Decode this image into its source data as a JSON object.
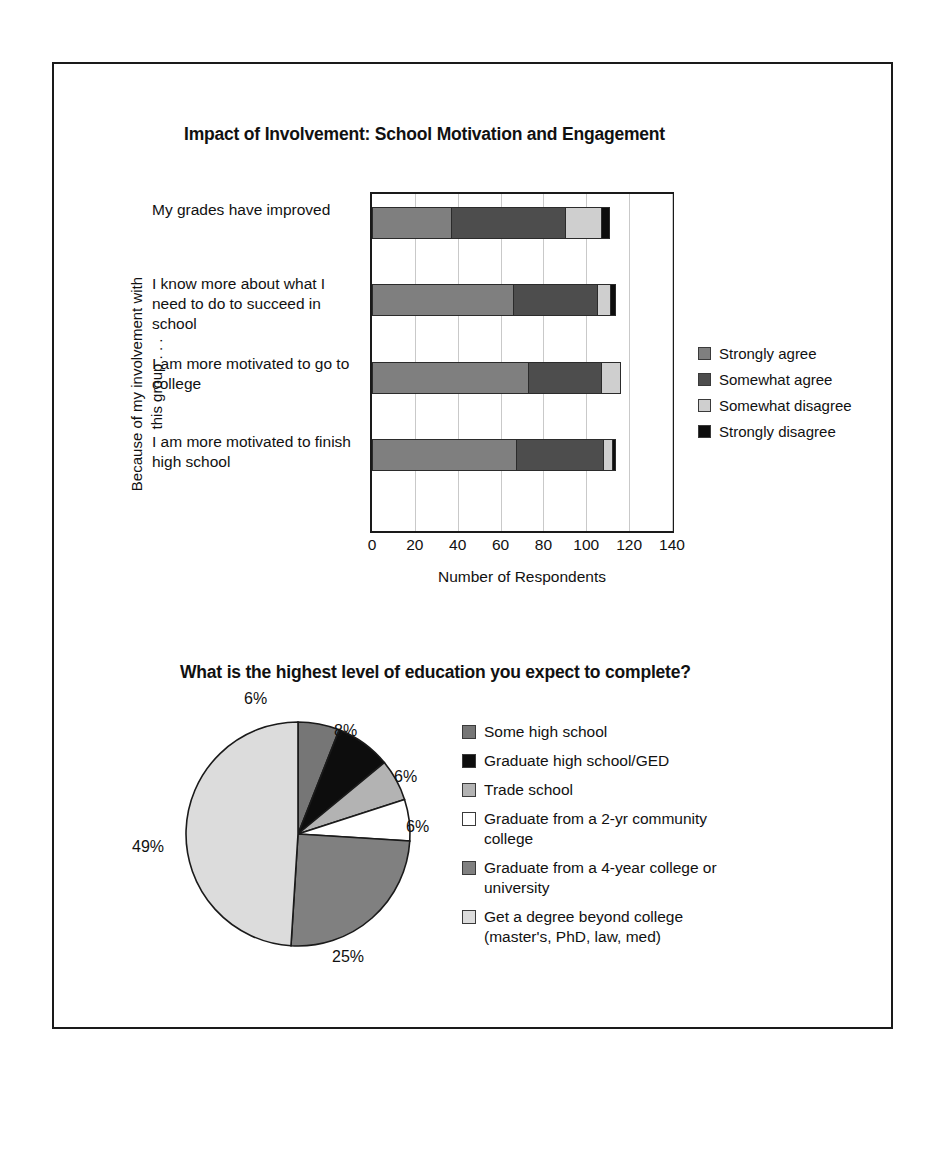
{
  "figure": {
    "bar_chart": {
      "title": "Impact of Involvement: School Motivation and Engagement",
      "yaxis_title": "Because of my involvement with this group . . .",
      "xaxis_title": "Number of Respondents",
      "xticks": [
        "0",
        "20",
        "40",
        "60",
        "80",
        "100",
        "120",
        "140"
      ],
      "legend": [
        {
          "label": "Strongly agree",
          "color": "#7f7f7f"
        },
        {
          "label": "Somewhat agree",
          "color": "#4d4d4d"
        },
        {
          "label": "Somewhat disagree",
          "color": "#cfcfcf"
        },
        {
          "label": "Strongly disagree",
          "color": "#0d0d0d"
        }
      ],
      "categories": [
        "My grades have improved",
        "I know more about what I need to do to succeed in school",
        "I am more motivated to go to college",
        "I am more motivated to finish high school"
      ]
    },
    "pie_chart": {
      "title": "What is the highest level of education you expect to complete?",
      "legend": [
        {
          "label": "Some high school",
          "color": "#767676"
        },
        {
          "label": "Graduate high school/GED",
          "color": "#0d0d0d"
        },
        {
          "label": "Trade school",
          "color": "#b3b3b3"
        },
        {
          "label": "Graduate from a 2-yr community college",
          "color": "#ffffff"
        },
        {
          "label": "Graduate from a 4-year college or university",
          "color": "#808080"
        },
        {
          "label": "Get a degree beyond college (master's, PhD, law, med)",
          "color": "#dcdcdc"
        }
      ],
      "labels": [
        "6%",
        "8%",
        "6%",
        "6%",
        "25%",
        "49%"
      ]
    }
  },
  "chart_data": [
    {
      "type": "bar",
      "orientation": "horizontal",
      "stacked": true,
      "title": "Impact of Involvement: School Motivation and Engagement",
      "xlabel": "Number of Respondents",
      "ylabel": "Because of my involvement with this group . . .",
      "xlim": [
        0,
        140
      ],
      "xticks": [
        0,
        20,
        40,
        60,
        80,
        100,
        120,
        140
      ],
      "grid": "vertical",
      "legend_position": "right",
      "categories": [
        "My grades have improved",
        "I know more about what I need to do to succeed in school",
        "I am more motivated to go to college",
        "I am more motivated to finish high school"
      ],
      "series": [
        {
          "name": "Strongly agree",
          "color": "#7f7f7f",
          "values": [
            37,
            66,
            73,
            67
          ]
        },
        {
          "name": "Somewhat agree",
          "color": "#4d4d4d",
          "values": [
            53,
            39,
            34,
            41
          ]
        },
        {
          "name": "Somewhat disagree",
          "color": "#cfcfcf",
          "values": [
            17,
            6,
            9,
            4
          ]
        },
        {
          "name": "Strongly disagree",
          "color": "#0d0d0d",
          "values": [
            4,
            3,
            0,
            2
          ]
        }
      ]
    },
    {
      "type": "pie",
      "title": "What is the highest level of education you expect to complete?",
      "legend_position": "right",
      "start_angle_deg": 0,
      "direction": "clockwise",
      "labels": [
        "Some high school",
        "Graduate high school/GED",
        "Trade school",
        "Graduate from a 2-yr community college",
        "Graduate from a 4-year college or university",
        "Get a degree beyond college (master's, PhD, law, med)"
      ],
      "values": [
        6,
        8,
        6,
        6,
        25,
        49
      ],
      "value_labels": [
        "6%",
        "8%",
        "6%",
        "6%",
        "25%",
        "49%"
      ],
      "colors": [
        "#767676",
        "#0d0d0d",
        "#b3b3b3",
        "#ffffff",
        "#808080",
        "#dcdcdc"
      ]
    }
  ]
}
